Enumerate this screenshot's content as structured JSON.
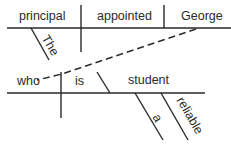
{
  "diagram": {
    "type": "Reed-Kellogg sentence diagram",
    "main_clause": {
      "subject": "principal",
      "verb": "appointed",
      "object": "George",
      "modifiers": [
        {
          "word": "The",
          "modifies": "principal"
        }
      ]
    },
    "relative_clause": {
      "subject": "who",
      "verb": "is",
      "predicate_nominative": "student",
      "modifiers": [
        {
          "word": "a",
          "modifies": "student"
        },
        {
          "word": "reliable",
          "modifies": "student"
        }
      ],
      "connects_to": "George"
    },
    "colors": {
      "ink": "#2a2a2a",
      "background": "#ffffff"
    }
  }
}
